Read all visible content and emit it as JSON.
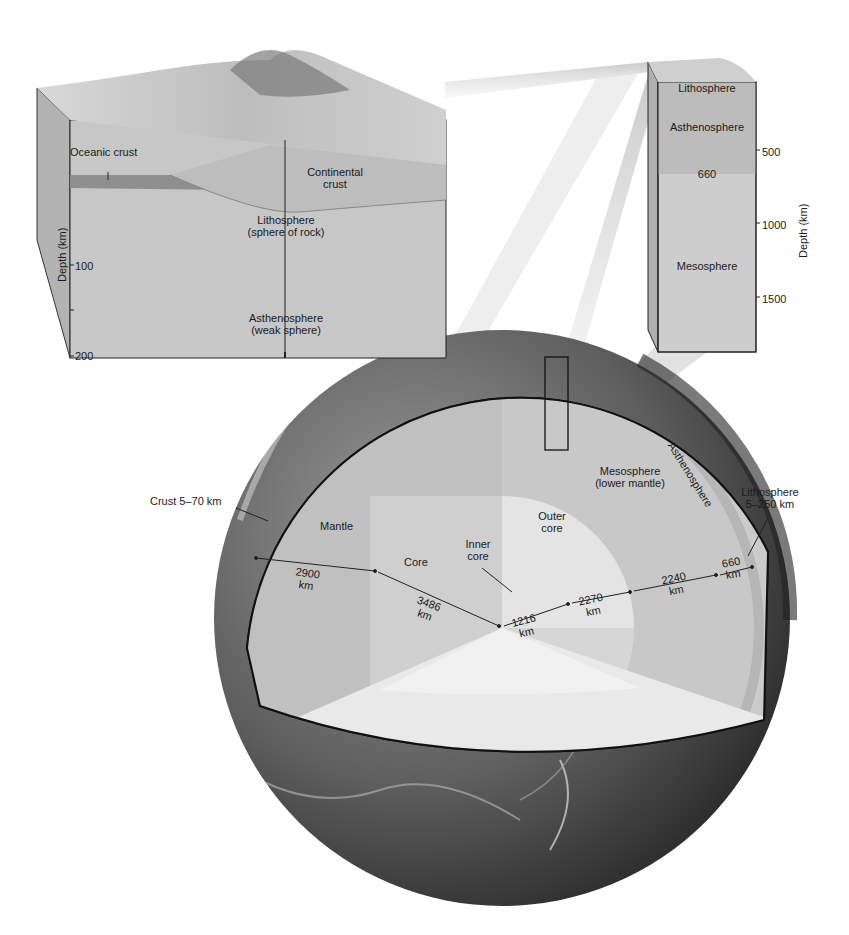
{
  "colors": {
    "background": "#ffffff",
    "block_face": "#c9c9c9",
    "block_side": "#b0b0b0",
    "oceanic_crust": "#8f8f8f",
    "mantle": "#c2c2c2",
    "outer_core": "#d9d9d9",
    "inner_core": "#e6e6e6",
    "mesosphere": "#cfcfcf",
    "asthenosphere": "#b9b9b9",
    "earth_surface": "#4a4a4a",
    "outline": "#1a1a1a"
  },
  "lithosphere_block": {
    "labels": {
      "oceanic_crust": "Oceanic crust",
      "continental_crust_line1": "Continental",
      "continental_crust_line2": "crust",
      "lithosphere_line1": "Lithosphere",
      "lithosphere_line2": "(sphere of rock)",
      "asthenosphere_line1": "Asthenosphere",
      "asthenosphere_line2": "(weak sphere)"
    },
    "axis": {
      "title": "Depth (km)",
      "ticks": [
        "100",
        "200"
      ]
    }
  },
  "mantle_column": {
    "labels": {
      "lithosphere": "Lithosphere",
      "asthenosphere": "Asthenosphere",
      "boundary_depth": "660",
      "mesosphere": "Mesosphere"
    },
    "axis": {
      "title": "Depth (km)",
      "ticks": [
        "500",
        "1000",
        "1500"
      ]
    }
  },
  "globe": {
    "labels": {
      "crust": "Crust 5–70 km",
      "mantle": "Mantle",
      "core": "Core",
      "inner_core_line1": "Inner",
      "inner_core_line2": "core",
      "outer_core_line1": "Outer",
      "outer_core_line2": "core",
      "mesosphere_line1": "Mesosphere",
      "mesosphere_line2": "(lower mantle)",
      "asthenosphere": "Asthenosphere",
      "lithosphere_line1": "Lithosphere",
      "lithosphere_line2": "5–250 km"
    },
    "distances": [
      {
        "value": "2900",
        "unit": "km"
      },
      {
        "value": "3486",
        "unit": "km"
      },
      {
        "value": "1216",
        "unit": "km"
      },
      {
        "value": "2270",
        "unit": "km"
      },
      {
        "value": "2240",
        "unit": "km"
      },
      {
        "value": "660",
        "unit": "km"
      }
    ]
  }
}
